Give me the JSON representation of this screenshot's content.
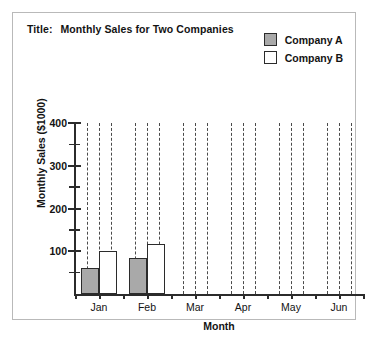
{
  "title": {
    "prefix": "Title:",
    "text": "Monthly Sales for Two Companies"
  },
  "legend": {
    "position": "top-right",
    "items": [
      {
        "label": "Company A",
        "color": "#a9a9a9"
      },
      {
        "label": "Company B",
        "color": "#ffffff"
      }
    ]
  },
  "axis": {
    "y_title": "Monthly Sales ($1000)",
    "x_title": "Month",
    "y_major_labels": [
      "100",
      "200",
      "300",
      "400"
    ],
    "y_minor_values": [
      50,
      150,
      250,
      350
    ]
  },
  "chart_data": {
    "type": "bar",
    "title": "Monthly Sales for Two Companies",
    "xlabel": "Month",
    "ylabel": "Monthly Sales ($1000)",
    "categories": [
      "Jan",
      "Feb",
      "Mar",
      "Apr",
      "May",
      "Jun"
    ],
    "series": [
      {
        "name": "Company A",
        "color": "#a9a9a9",
        "values": [
          60,
          85,
          null,
          null,
          null,
          null
        ]
      },
      {
        "name": "Company B",
        "color": "#ffffff",
        "values": [
          100,
          118,
          null,
          null,
          null,
          null
        ]
      }
    ],
    "ylim": [
      0,
      400
    ],
    "y_major_ticks": [
      100,
      200,
      300,
      400
    ],
    "y_minor_ticks": [
      50,
      150,
      250,
      350
    ],
    "grid": "vertical-dashed",
    "gridlines_per_category": 3,
    "legend_position": "top-right"
  }
}
